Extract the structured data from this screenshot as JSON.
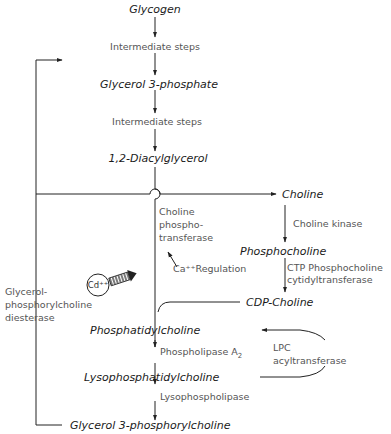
{
  "diagram": {
    "nodes": {
      "glycogen": "Glycogen",
      "glycerol3p": "Glycerol 3-phosphate",
      "dag": "1,2-Diacylglycerol",
      "choline": "Choline",
      "phosphocholine": "Phosphocholine",
      "cdp_choline": "CDP-Choline",
      "pc": "Phosphatidylcholine",
      "lpc": "Lysophosphatidylcholine",
      "gpc": "Glycerol 3-phosphorylcholine"
    },
    "steps": {
      "intermediate1": "Intermediate steps",
      "intermediate2": "Intermediate steps",
      "choline_kinase": "Choline kinase",
      "ctp_1": "CTP Phosphocholine",
      "ctp_2": "cytidyltransferase",
      "cpt_1": "Choline",
      "cpt_2": "phospho-",
      "cpt_3": "transferase",
      "ca_regulation": "Ca⁺⁺Regulation",
      "cd": "Cd⁺⁺",
      "gpc_diesterase_1": "Glycerol-",
      "gpc_diesterase_2": "phosphorylcholine",
      "gpc_diesterase_3": "diesterase",
      "lpc_acyl_1": "LPC",
      "lpc_acyl_2": "acyltransferase",
      "pla2": "Phospholipase A",
      "pla2_sub": "2",
      "lysophospholipase": "Lysophospholipase"
    },
    "colors": {
      "line": "#222222",
      "node_text": "#1a1a1a",
      "step_text": "#555555"
    }
  }
}
